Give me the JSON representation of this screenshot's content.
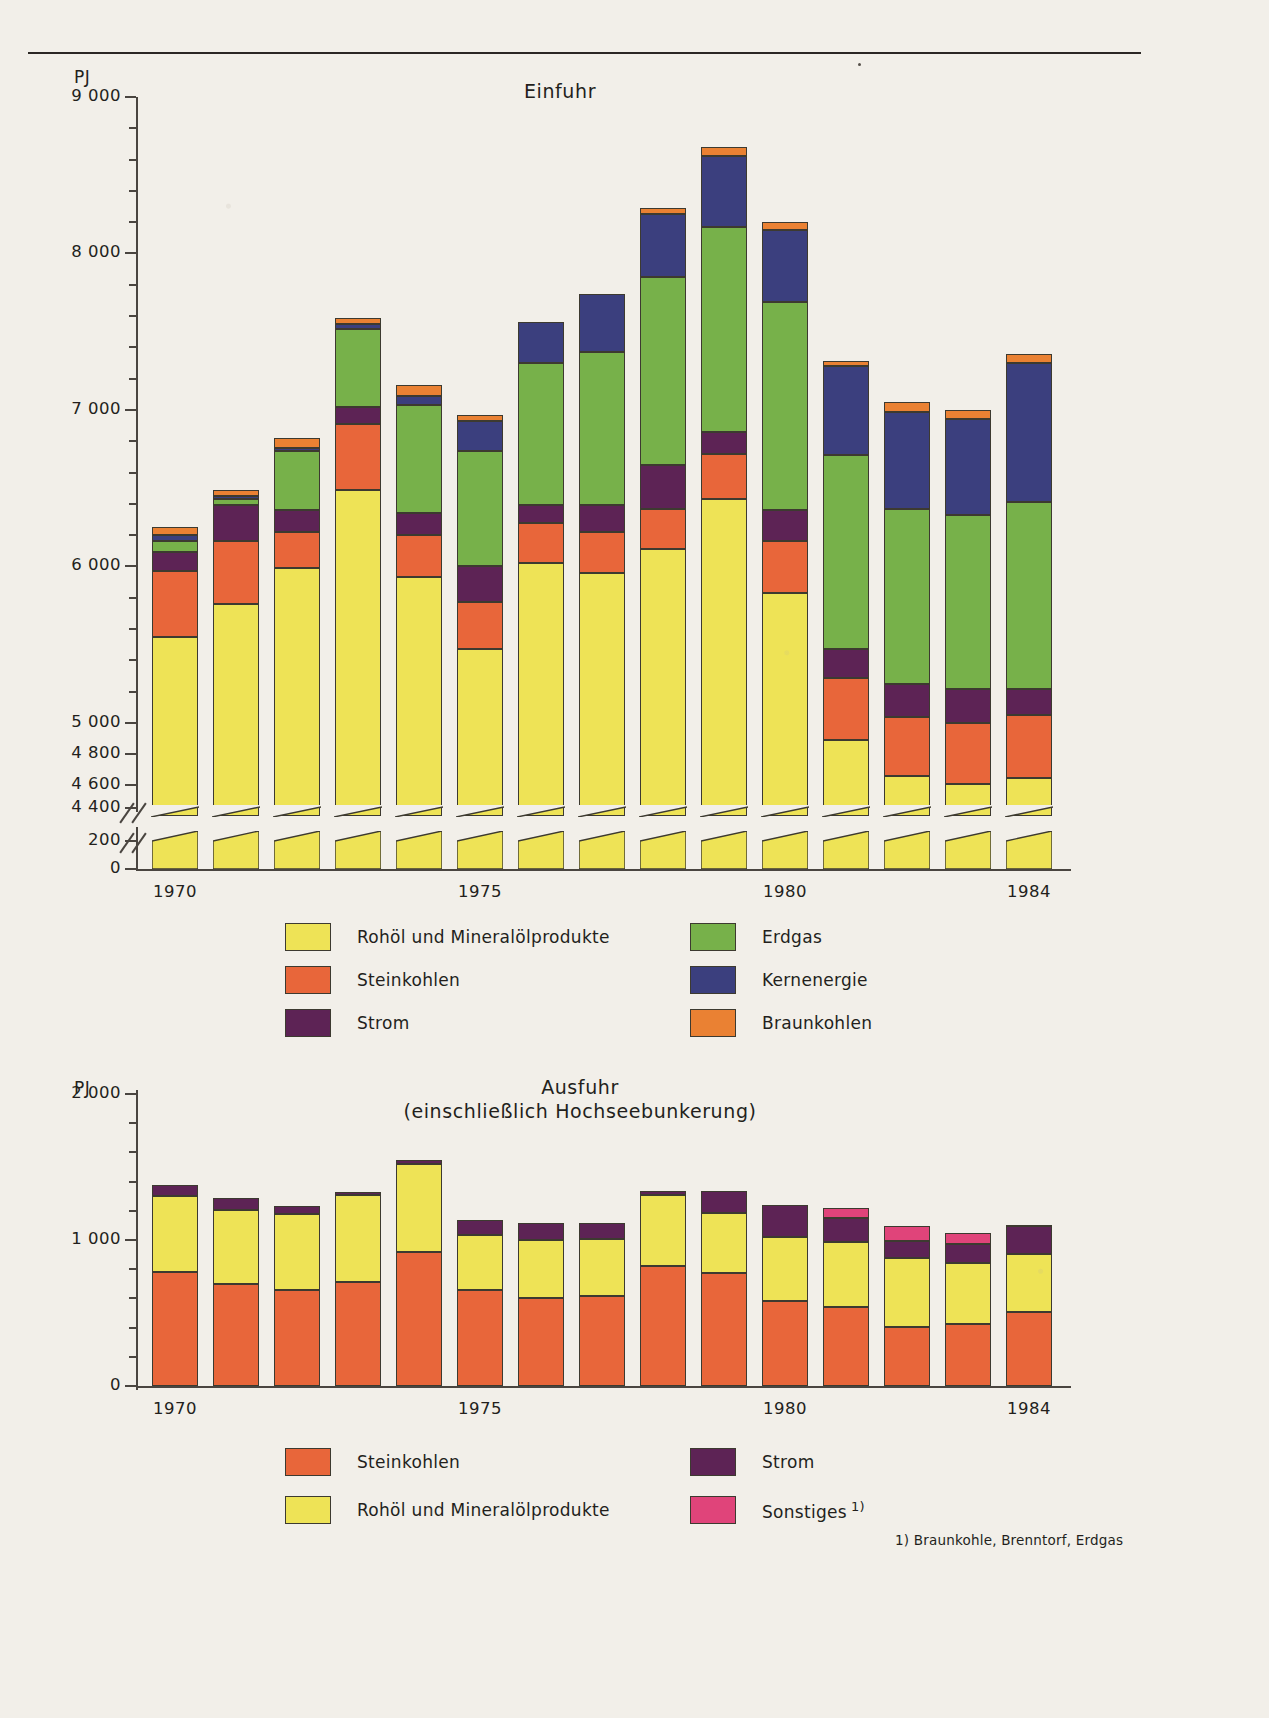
{
  "palette": {
    "paper": "#f2efe9",
    "ink": "#2b2724",
    "axis": "#4a4540",
    "rohoel": "#eee356",
    "steinkohlen": "#e8663a",
    "strom": "#5d2355",
    "erdgas": "#77b14a",
    "kernenergie": "#3b3f7e",
    "braunkohlen": "#ea8133",
    "sonstiges": "#e0447a"
  },
  "top": {
    "unit": "PJ",
    "title": "Einfuhr",
    "y_ticks_major": [
      "9 000",
      "8 000",
      "7 000",
      "6 000",
      "5 000",
      "4 800",
      "4 600",
      "4 400",
      "200",
      "0"
    ],
    "x_tick_labels": [
      "1970",
      "1975",
      "1980",
      "1984"
    ],
    "legend": [
      {
        "label": "Rohöl und Mineralölprodukte",
        "color": "#eee356"
      },
      {
        "label": "Erdgas",
        "color": "#77b14a"
      },
      {
        "label": "Steinkohlen",
        "color": "#e8663a"
      },
      {
        "label": "Kernenergie",
        "color": "#3b3f7e"
      },
      {
        "label": "Strom",
        "color": "#5d2355"
      },
      {
        "label": "Braunkohlen",
        "color": "#ea8133"
      }
    ]
  },
  "bottom": {
    "unit": "PJ",
    "title": "Ausfuhr\n(einschließlich Hochseebunkerung)",
    "y_ticks_major": [
      "2 000",
      "1 000",
      "0"
    ],
    "x_tick_labels": [
      "1970",
      "1975",
      "1980",
      "1984"
    ],
    "legend": [
      {
        "label": "Steinkohlen",
        "color": "#e8663a"
      },
      {
        "label": "Strom",
        "color": "#5d2355"
      },
      {
        "label": "Rohöl und Mineralölprodukte",
        "color": "#eee356"
      },
      {
        "label": "Sonstiges",
        "color": "#e0447a",
        "sup": "1)"
      }
    ],
    "footnote": "1) Braunkohle, Brenntorf, Erdgas"
  },
  "chart_data": [
    {
      "type": "bar",
      "title": "Einfuhr",
      "subtitle": "",
      "xlabel": "",
      "ylabel": "PJ",
      "stacked": true,
      "grid": false,
      "legend_position": "below",
      "axis_break": {
        "low_range": [
          0,
          200
        ],
        "high_range": [
          4400,
          9000
        ],
        "note": "y-axis broken between 200 and 4 400"
      },
      "ylim": [
        0,
        9000
      ],
      "yticks": [
        4400,
        4600,
        4800,
        5000,
        6000,
        7000,
        8000,
        9000
      ],
      "yticks_low": [
        0,
        200
      ],
      "categories": [
        "1970",
        "1971",
        "1972",
        "1973",
        "1974",
        "1975",
        "1976",
        "1977",
        "1978",
        "1979",
        "1980",
        "1981",
        "1982",
        "1983",
        "1984"
      ],
      "series": [
        {
          "name": "Rohöl und Mineralölprodukte",
          "color": "#eee356",
          "values": [
            5550,
            5760,
            5990,
            6490,
            5930,
            5470,
            6020,
            5960,
            6110,
            6430,
            5830,
            4890,
            4660,
            4610,
            4650
          ]
        },
        {
          "name": "Steinkohlen",
          "color": "#e8663a",
          "values": [
            420,
            400,
            230,
            420,
            270,
            300,
            260,
            260,
            260,
            290,
            330,
            400,
            380,
            390,
            400
          ]
        },
        {
          "name": "Strom",
          "color": "#5d2355",
          "values": [
            120,
            230,
            140,
            110,
            140,
            230,
            110,
            170,
            280,
            140,
            200,
            180,
            210,
            220,
            170
          ]
        },
        {
          "name": "Erdgas",
          "color": "#77b14a",
          "values": [
            70,
            40,
            380,
            500,
            690,
            740,
            910,
            980,
            1200,
            1310,
            1330,
            1240,
            1120,
            1110,
            1190
          ]
        },
        {
          "name": "Kernenergie",
          "color": "#3b3f7e",
          "values": [
            40,
            20,
            20,
            30,
            60,
            190,
            260,
            370,
            400,
            450,
            460,
            570,
            620,
            610,
            890
          ]
        },
        {
          "name": "Braunkohlen",
          "color": "#ea8133",
          "values": [
            50,
            40,
            60,
            40,
            70,
            40,
            0,
            0,
            40,
            60,
            50,
            30,
            60,
            60,
            60
          ]
        }
      ],
      "totals": [
        6250,
        6490,
        6890,
        7580,
        7180,
        6980,
        7570,
        7750,
        8000,
        8600,
        8180,
        7300,
        7070,
        7010,
        7340
      ]
    },
    {
      "type": "bar",
      "title": "Ausfuhr (einschließlich Hochseebunkerung)",
      "xlabel": "",
      "ylabel": "PJ",
      "stacked": true,
      "grid": false,
      "legend_position": "below",
      "ylim": [
        0,
        2000
      ],
      "yticks": [
        0,
        1000,
        2000
      ],
      "categories": [
        "1970",
        "1971",
        "1972",
        "1973",
        "1974",
        "1975",
        "1976",
        "1977",
        "1978",
        "1979",
        "1980",
        "1981",
        "1982",
        "1983",
        "1984"
      ],
      "series": [
        {
          "name": "Steinkohlen",
          "color": "#e8663a",
          "values": [
            780,
            700,
            655,
            715,
            915,
            660,
            600,
            615,
            820,
            775,
            585,
            540,
            405,
            425,
            505
          ]
        },
        {
          "name": "Rohöl und Mineralölprodukte",
          "color": "#eee356",
          "values": [
            520,
            505,
            520,
            590,
            605,
            375,
            400,
            390,
            490,
            410,
            435,
            445,
            470,
            420,
            400
          ]
        },
        {
          "name": "Strom",
          "color": "#5d2355",
          "values": [
            80,
            85,
            55,
            25,
            25,
            100,
            115,
            110,
            25,
            150,
            220,
            165,
            115,
            125,
            190
          ]
        },
        {
          "name": "Sonstiges",
          "color": "#e0447a",
          "values": [
            0,
            0,
            0,
            0,
            0,
            0,
            0,
            0,
            0,
            0,
            0,
            70,
            105,
            75,
            10
          ]
        }
      ],
      "totals": [
        1380,
        1290,
        1230,
        1330,
        1545,
        1135,
        1115,
        1115,
        1335,
        1345,
        1240,
        1220,
        1095,
        1045,
        1105
      ]
    }
  ]
}
